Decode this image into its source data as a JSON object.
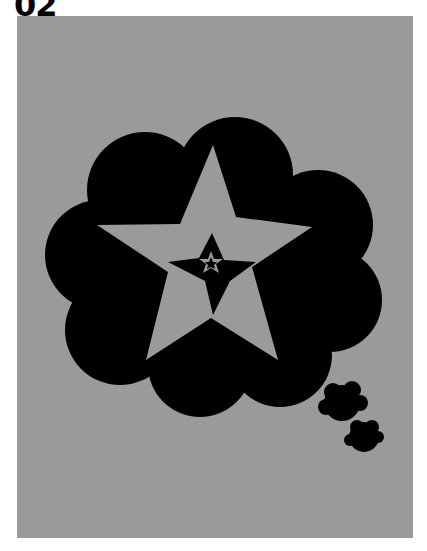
{
  "label": {
    "text": "02"
  },
  "artwork": {
    "description": "Black thought-bubble cloud containing nested gray five-pointed stars",
    "background_color": "#9a9a9a",
    "shape_color": "#000000",
    "shapes": [
      "cloud",
      "large-star",
      "small-star",
      "tiny-star",
      "small-bubble-1",
      "small-bubble-2"
    ]
  }
}
